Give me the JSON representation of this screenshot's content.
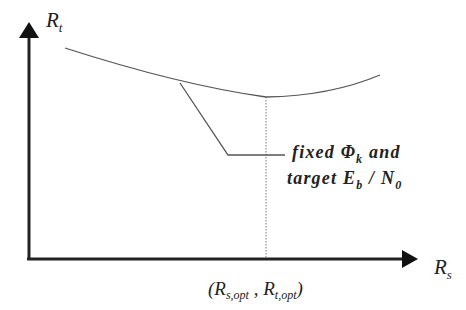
{
  "diagram": {
    "y_axis": {
      "label_main": "R",
      "label_sub": "t"
    },
    "x_axis": {
      "label_main": "R",
      "label_sub": "s"
    },
    "optimum_point": {
      "open": "(",
      "r1": "R",
      "r1_sub": "s,opt",
      "comma": " , ",
      "r2": "R",
      "r2_sub": "t,opt",
      "close": ")"
    },
    "annotation": {
      "line1_text": "fixed ",
      "line1_symbol": "Φ",
      "line1_symbol_sub": "k",
      "line1_tail": " and",
      "line2_text": "target ",
      "line2_e": "E",
      "line2_e_sub": "b",
      "line2_slash": " / ",
      "line2_n": "N",
      "line2_n_sub": "0"
    },
    "colors": {
      "axis": "#222222",
      "curve": "#555555",
      "dotted": "#777777"
    }
  }
}
